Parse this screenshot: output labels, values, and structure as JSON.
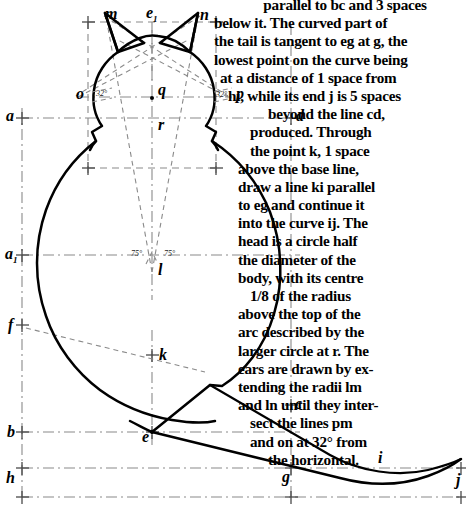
{
  "document": {
    "type": "geometric-construction-plate",
    "subject": "cat-figure-construction"
  },
  "instructions": {
    "lines": [
      "parallel to bc and 3 spaces",
      "below it. The curved part of",
      "the tail is tangent to eg at g, the",
      "lowest point on the curve being",
      "at a distance of 1 space from",
      "hi, while its end j is 5 spaces",
      "beyond the line cd,",
      "produced. Through",
      "the point k, 1 space",
      "above the base line,",
      "draw a line ki parallel",
      "to eg and continue it",
      "into the curve ij. The",
      "head is a circle half",
      "the diameter of the",
      "body, with its centre",
      "1/8 of the radius",
      "above the top of the",
      "arc described by the",
      "larger circle at r. The",
      "ears are drawn by ex-",
      "tending the radii lm",
      "and ln until they inter-",
      "sect the lines pm",
      "and on at 32° from",
      "the horizontal."
    ]
  },
  "figure": {
    "labels": [
      {
        "id": "a",
        "text": "a",
        "x": 6,
        "y": 108
      },
      {
        "id": "a1",
        "text": "a",
        "sub": "1",
        "x": 5,
        "y": 246
      },
      {
        "id": "f",
        "text": "f",
        "x": 8,
        "y": 317
      },
      {
        "id": "b",
        "text": "b",
        "x": 7,
        "y": 424
      },
      {
        "id": "h",
        "text": "h",
        "x": 6,
        "y": 470
      },
      {
        "id": "m",
        "text": "m",
        "x": 105,
        "y": 6
      },
      {
        "id": "e1",
        "text": "e",
        "sub": "1",
        "x": 146,
        "y": 5
      },
      {
        "id": "n",
        "text": "n",
        "x": 200,
        "y": 7
      },
      {
        "id": "o",
        "text": "o",
        "x": 76,
        "y": 86
      },
      {
        "id": "q",
        "text": "q",
        "x": 158,
        "y": 84
      },
      {
        "id": "p",
        "text": "p",
        "x": 236,
        "y": 86
      },
      {
        "id": "r",
        "text": "r",
        "x": 158,
        "y": 117
      },
      {
        "id": "l",
        "text": "l",
        "x": 158,
        "y": 263
      },
      {
        "id": "k",
        "text": "k",
        "x": 159,
        "y": 348
      },
      {
        "id": "e",
        "text": "e",
        "x": 143,
        "y": 429
      },
      {
        "id": "d",
        "text": "d",
        "x": 295,
        "y": 108
      },
      {
        "id": "c",
        "text": "c",
        "x": 294,
        "y": 396
      },
      {
        "id": "g",
        "text": "g",
        "x": 283,
        "y": 470
      },
      {
        "id": "i",
        "text": "i",
        "x": 378,
        "y": 450
      },
      {
        "id": "j",
        "text": "j",
        "x": 456,
        "y": 473
      }
    ],
    "angles": [
      {
        "id": "angle-o",
        "text": "32°",
        "x": 96,
        "y": 88
      },
      {
        "id": "angle-p",
        "text": "32°",
        "x": 215,
        "y": 89
      },
      {
        "id": "angle-l",
        "text": "75°",
        "x": 133,
        "y": 251
      },
      {
        "id": "angle-l2",
        "text": "75°",
        "x": 163,
        "y": 251
      }
    ],
    "colors": {
      "ink": "#000000",
      "construction": "#7d7d7d",
      "paper": "#ffffff"
    }
  }
}
